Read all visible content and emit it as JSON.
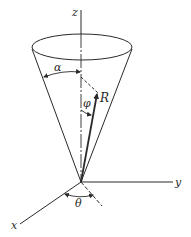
{
  "figure": {
    "labels": {
      "z": "z",
      "y": "y",
      "x": "x",
      "alpha": "α",
      "phi": "φ",
      "R": "R",
      "theta": "θ"
    },
    "colors": {
      "line": "#2a2a2a",
      "background": "#ffffff"
    }
  }
}
